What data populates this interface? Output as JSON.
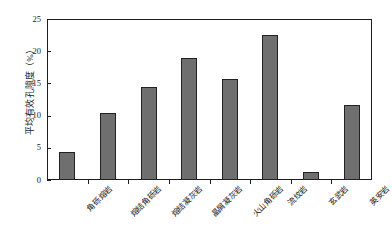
{
  "chart_data": {
    "type": "bar",
    "title": "",
    "xlabel": "",
    "ylabel": "平均有效孔隙度（%）",
    "ylim": [
      0,
      25
    ],
    "yticks": [
      "0",
      "5",
      "10",
      "15",
      "20",
      "25"
    ],
    "ytick_values": [
      0,
      5,
      10,
      15,
      20,
      25
    ],
    "grid": false,
    "legend": null,
    "categories": [
      "角砾熔岩",
      "熔结角砾岩",
      "熔结凝灰岩",
      "晶屑凝灰岩",
      "火山角砾岩",
      "流纹岩",
      "玄武岩",
      "英安岩"
    ],
    "values": [
      4.4,
      10.4,
      14.4,
      19.0,
      15.7,
      22.5,
      1.3,
      11.7
    ],
    "bar_color": "#6f6f6f",
    "bar_edge_color": "#222222",
    "axis_color": "#1d1d1d",
    "background_color": "#ffffff"
  }
}
